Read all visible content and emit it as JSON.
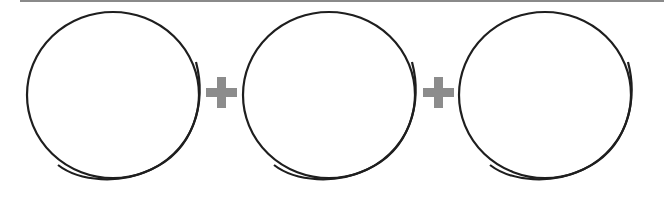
{
  "diagram": {
    "type": "equation-of-shapes",
    "colors": {
      "background": "#ffffff",
      "circle_stroke": "#1e1e1e",
      "plus_fill": "#8c8c8c",
      "top_rule": "#8a8a8a"
    },
    "items": [
      {
        "kind": "circle",
        "label": ""
      },
      {
        "kind": "operator",
        "symbol": "+"
      },
      {
        "kind": "circle",
        "label": ""
      },
      {
        "kind": "operator",
        "symbol": "+"
      },
      {
        "kind": "circle",
        "label": ""
      }
    ],
    "icons": [
      "plus-icon",
      "plus-icon"
    ]
  }
}
